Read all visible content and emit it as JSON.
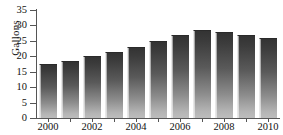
{
  "chart_data": {
    "type": "bar",
    "title": "",
    "xlabel": "",
    "ylabel": "Gallons",
    "ylim": [
      0,
      35
    ],
    "yticks": [
      0,
      5,
      10,
      15,
      20,
      25,
      30,
      35
    ],
    "ytick_labels": [
      "0",
      "5",
      "10",
      "15",
      "20",
      "25",
      "30",
      "35"
    ],
    "grid": false,
    "legend": null,
    "categories": [
      "2000",
      "2001",
      "2002",
      "2003",
      "2004",
      "2005",
      "2006",
      "2007",
      "2008",
      "2009",
      "2010"
    ],
    "xtick_labels_shown": [
      "2000",
      "2002",
      "2004",
      "2006",
      "2008",
      "2010"
    ],
    "values": [
      17.5,
      18.5,
      20.0,
      21.5,
      23.0,
      25.0,
      27.0,
      28.5,
      28.0,
      27.0,
      26.0
    ],
    "bar_color_top": "#333333",
    "bar_color_bottom": "#bdbdbd",
    "axis_color": "#555555"
  }
}
